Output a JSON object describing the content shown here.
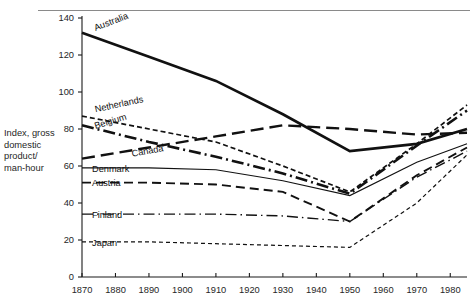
{
  "figure": {
    "title": "",
    "y_axis_label": "Index, gross\ndomestic\nproduct/\nman-hour"
  },
  "chart_data": {
    "type": "line",
    "title": "",
    "xlabel": "",
    "ylabel": "Index, gross domestic product/ man-hour",
    "xlim": [
      1870,
      1985
    ],
    "ylim": [
      0,
      140
    ],
    "xticks": [
      1870,
      1880,
      1890,
      1900,
      1910,
      1920,
      1930,
      1940,
      1950,
      1960,
      1970,
      1980
    ],
    "yticks": [
      0,
      20,
      40,
      60,
      80,
      100,
      120,
      140
    ],
    "grid": false,
    "legend": "inline-labels",
    "x": [
      1870,
      1890,
      1910,
      1930,
      1950,
      1970,
      1985
    ],
    "series": [
      {
        "name": "Australia",
        "line_style": "solid-thick",
        "label_x": 1874,
        "label_y": 133,
        "label_rotation": -21,
        "values": [
          132,
          119,
          106,
          88,
          68,
          72,
          80
        ]
      },
      {
        "name": "Netherlands",
        "line_style": "dashed-fine",
        "label_x": 1874,
        "label_y": 89,
        "label_rotation": -12,
        "values": [
          87,
          80,
          73,
          60,
          46,
          72,
          93
        ]
      },
      {
        "name": "Belgium",
        "line_style": "dash-dot-thick",
        "label_x": 1874,
        "label_y": 80,
        "label_rotation": -17,
        "values": [
          82,
          73,
          65,
          56,
          45,
          71,
          90
        ]
      },
      {
        "name": "Canada",
        "line_style": "dashed-long",
        "label_x": 1885,
        "label_y": 65,
        "label_rotation": -10,
        "values": [
          64,
          70,
          76,
          82,
          80,
          77,
          78
        ]
      },
      {
        "name": "Denmark",
        "line_style": "solid-thin",
        "label_x": 1873,
        "label_y": 57,
        "label_rotation": 0,
        "values": [
          59,
          59,
          58,
          52,
          44,
          62,
          72
        ]
      },
      {
        "name": "Austria",
        "line_style": "dashed-medium",
        "label_x": 1873,
        "label_y": 49,
        "label_rotation": 0,
        "values": [
          51,
          51,
          50,
          46,
          30,
          55,
          70
        ]
      },
      {
        "name": "Finland",
        "line_style": "dash-dot-thin",
        "label_x": 1873,
        "label_y": 32,
        "label_rotation": 0,
        "values": [
          34,
          34,
          34,
          33,
          30,
          54,
          68
        ]
      },
      {
        "name": "Japan",
        "line_style": "dotted-fine",
        "label_x": 1873,
        "label_y": 17,
        "label_rotation": 0,
        "values": [
          19,
          19,
          18,
          17,
          16,
          40,
          66
        ]
      }
    ]
  }
}
